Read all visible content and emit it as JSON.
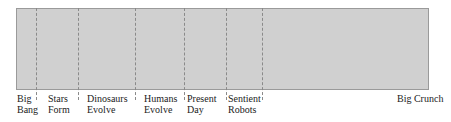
{
  "diagram": {
    "title": "",
    "box_color": "#d0d0d0",
    "border_color": "#9a9a9a",
    "dividers_x": [
      36,
      78,
      135,
      184,
      226,
      262
    ],
    "labels": [
      {
        "line1": "Big",
        "line2": "Bang",
        "x": 17
      },
      {
        "line1": "Stars",
        "line2": "Form",
        "x": 48
      },
      {
        "line1": "Dinosaurs",
        "line2": "Evolve",
        "x": 87
      },
      {
        "line1": "Humans",
        "line2": "Evolve",
        "x": 144
      },
      {
        "line1": "Present",
        "line2": "Day",
        "x": 187
      },
      {
        "line1": "Sentient",
        "line2": "Robots",
        "x": 228
      },
      {
        "line1": "Big Crunch",
        "line2": "",
        "x": 397
      }
    ]
  }
}
